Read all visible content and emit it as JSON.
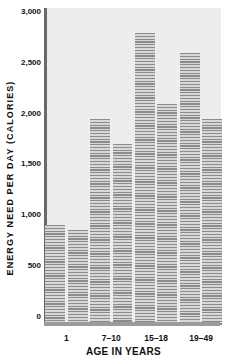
{
  "chart": {
    "y_axis_title": "ENERGY NEED PER DAY (CALORIES)",
    "x_axis_title": "AGE IN YEARS"
  },
  "chart_data": {
    "type": "bar",
    "title": "",
    "xlabel": "AGE IN YEARS",
    "ylabel": "ENERGY NEED PER DAY (CALORIES)",
    "categories": [
      "1",
      "7–10",
      "15–18",
      "19–49"
    ],
    "series": [
      {
        "name": "left bar of pair",
        "values": [
          900,
          1950,
          2800,
          2600
        ]
      },
      {
        "name": "right bar of pair",
        "values": [
          850,
          1700,
          2100,
          1950
        ]
      }
    ],
    "ylim": [
      0,
      3000
    ],
    "ytick_interval": 500,
    "ytick_labels": [
      "0",
      "500",
      "1,000",
      "1,500",
      "2,000",
      "2,500",
      "3,000"
    ],
    "grid": false,
    "legend": false,
    "bar_fill_style": "horizontal-hatch-stripes",
    "colors": {
      "plot_background": "#ededed",
      "bar_stripe_dark": "#8c8c8c",
      "bar_stripe_light": "#d7d7d7",
      "y_axis_line": "#6a6a6a",
      "x_axis_line": "#9b9b9b",
      "text": "#111111"
    }
  }
}
